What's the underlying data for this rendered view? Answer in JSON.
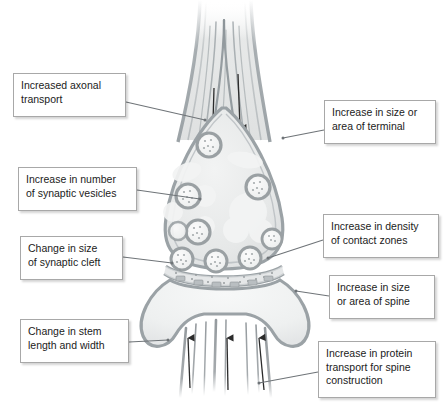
{
  "figure": {
    "background_color": "#ffffff",
    "membrane_color": "#9ba2a6",
    "cytoplasm_color": "#e9eaea",
    "vesicle_ring_color": "#9aa0a3",
    "label_border_color": "#a8a8a8",
    "label_text_color": "#1b1b1b",
    "leader_line_color": "#6f7478",
    "arrow_color": "#2b2b2b"
  },
  "callouts": [
    {
      "id": "axonal-transport",
      "text": "Increased axonal\ntransport",
      "side": "left",
      "box": {
        "x": 13,
        "y": 73,
        "w": 113,
        "h": 44
      },
      "leader": {
        "x1": 126,
        "y1": 102,
        "x2": 205,
        "y2": 120
      }
    },
    {
      "id": "terminal-size",
      "text": "Increase in size or\narea of terminal",
      "side": "right",
      "box": {
        "x": 324,
        "y": 100,
        "w": 112,
        "h": 44
      },
      "leader": {
        "x1": 324,
        "y1": 130,
        "x2": 283,
        "y2": 138
      }
    },
    {
      "id": "vesicle-number",
      "text": "Increase in number\nof synaptic vesicles",
      "side": "left",
      "box": {
        "x": 18,
        "y": 167,
        "w": 119,
        "h": 44
      },
      "leader": {
        "x1": 137,
        "y1": 190,
        "x2": 200,
        "y2": 199
      }
    },
    {
      "id": "synaptic-cleft",
      "text": "Change in size\nof synaptic cleft",
      "side": "left",
      "box": {
        "x": 20,
        "y": 236,
        "w": 103,
        "h": 44
      },
      "leader": {
        "x1": 123,
        "y1": 257,
        "x2": 172,
        "y2": 263
      }
    },
    {
      "id": "contact-zones",
      "text": "Increase in density\nof contact zones",
      "side": "right",
      "box": {
        "x": 323,
        "y": 214,
        "w": 116,
        "h": 44
      },
      "leader": {
        "x1": 323,
        "y1": 240,
        "x2": 268,
        "y2": 258
      }
    },
    {
      "id": "spine-size",
      "text": "Increase in size\nor area of spine",
      "side": "right",
      "box": {
        "x": 329,
        "y": 275,
        "w": 106,
        "h": 44
      },
      "leader": {
        "x1": 329,
        "y1": 296,
        "x2": 296,
        "y2": 291
      }
    },
    {
      "id": "stem-length",
      "text": "Change in stem\nlength and width",
      "side": "left",
      "box": {
        "x": 20,
        "y": 319,
        "w": 109,
        "h": 44
      },
      "leader": {
        "x1": 129,
        "y1": 342,
        "x2": 168,
        "y2": 340
      }
    },
    {
      "id": "protein-transport",
      "text": "Increase in protein\ntransport for spine\nconstruction",
      "side": "right",
      "box": {
        "x": 318,
        "y": 341,
        "w": 118,
        "h": 57
      },
      "leader": {
        "x1": 318,
        "y1": 372,
        "x2": 259,
        "y2": 383
      }
    }
  ],
  "diagram_parts": [
    {
      "name": "axon-shaft",
      "label": "Axon shaft fading at top"
    },
    {
      "name": "microtubules-axon",
      "label": "Microtubule tracks in axon"
    },
    {
      "name": "axonal-transport-arrows",
      "label": "Downward transport arrows",
      "count": 2,
      "direction": "down"
    },
    {
      "name": "presynaptic-terminal",
      "label": "Presynaptic terminal bouton"
    },
    {
      "name": "synaptic-vesicles",
      "label": "Synaptic vesicles",
      "count": 9
    },
    {
      "name": "mitochondria-blobs",
      "label": "Pale organelle blobs",
      "count": 6
    },
    {
      "name": "synaptic-cleft",
      "label": "Synaptic cleft speckled band"
    },
    {
      "name": "contact-zone-densities",
      "label": "Postsynaptic density patches",
      "count": 6
    },
    {
      "name": "dendritic-spine-head",
      "label": "Dendritic spine head"
    },
    {
      "name": "spine-neck",
      "label": "Spine neck / stem"
    },
    {
      "name": "spine-transport-filaments",
      "label": "Filaments in spine neck",
      "count": 9
    },
    {
      "name": "spine-transport-arrows",
      "label": "Upward transport arrows",
      "count": 3,
      "direction": "up"
    }
  ]
}
